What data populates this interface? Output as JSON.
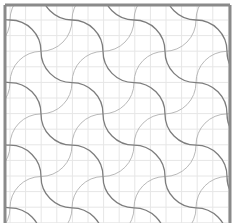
{
  "diagram": {
    "type": "quilting-pattern",
    "width": 234,
    "height": 223,
    "background": "#ffffff",
    "frame": {
      "color": "#8a8a8a",
      "stroke_width": 3,
      "left": 5,
      "top": 5,
      "right": 230,
      "sides": [
        "top",
        "left",
        "right"
      ]
    },
    "grid": {
      "color": "#e6e6e6",
      "stroke_width": 1,
      "origin_x": 10,
      "origin_y": 20,
      "cell": 15.6
    },
    "lattice": {
      "origin_x": 10,
      "origin_y": 20,
      "step_x": 31,
      "step_y": 31.3,
      "cols": 8,
      "rows": 7
    },
    "curves": {
      "dark_color": "#7d7d7d",
      "dark_width": 1.3,
      "light_color": "#b9b9b9",
      "light_width": 1.0,
      "dark_direction": "down-right S-chains",
      "light_direction": "up-right S-chains"
    }
  }
}
